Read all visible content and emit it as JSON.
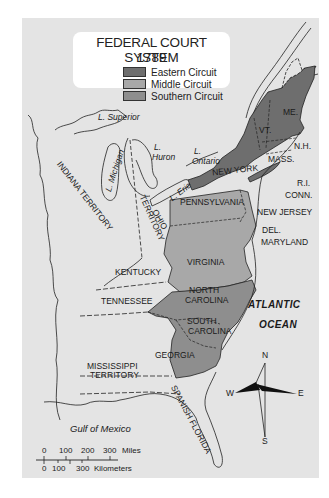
{
  "legend": {
    "title": "FEDERAL COURT SYSTEM",
    "year": "1789",
    "items": [
      {
        "label": "Eastern Circuit",
        "color": "#6e6e6e"
      },
      {
        "label": "Middle Circuit",
        "color": "#a8a8a8"
      },
      {
        "label": "Southern Circuit",
        "color": "#8e8e8e"
      }
    ]
  },
  "colors": {
    "background": "#e4e4e4",
    "unassigned_land": "#e4e4e4",
    "eastern": "#6e6e6e",
    "middle": "#a8a8a8",
    "southern": "#8e8e8e"
  },
  "regions": {
    "eastern": [
      "ME.",
      "VT.",
      "N.H.",
      "MASS.",
      "R.I.",
      "CONN.",
      "NEW YORK"
    ],
    "middle": [
      "PENNSYLVANIA",
      "NEW JERSEY",
      "DEL.",
      "MARYLAND",
      "VIRGINIA"
    ],
    "southern": [
      "NORTH CAROLINA",
      "SOUTH CAROLINA",
      "GEORGIA"
    ]
  },
  "labels": {
    "lake_superior": "L. Superior",
    "lake_michigan": "L. Michigan",
    "lake_huron_1": "L.",
    "lake_huron_2": "Huron",
    "lake_ontario_1": "L.",
    "lake_ontario_2": "Ontario",
    "lake_erie": "L. Erie",
    "indiana_territory": "INDIANA TERRITORY",
    "ohio_territory_1": "OHIO",
    "ohio_territory_2": "TERRITORY",
    "maine": "ME.",
    "vermont": "VT.",
    "new_hampshire": "N.H.",
    "massachusetts": "MASS.",
    "rhode_island": "R.I.",
    "connecticut": "CONN.",
    "new_york": "NEW YORK",
    "pennsylvania": "PENNSYLVANIA",
    "new_jersey": "NEW JERSEY",
    "delaware": "DEL.",
    "maryland": "MARYLAND",
    "virginia": "VIRGINIA",
    "kentucky": "KENTUCKY",
    "tennessee": "TENNESSEE",
    "north_carolina_1": "NORTH",
    "north_carolina_2": "CAROLINA",
    "south_carolina_1": "SOUTH",
    "south_carolina_2": "CAROLINA",
    "georgia": "GEORGIA",
    "mississippi_territory_1": "MISSISSIPPI",
    "mississippi_territory_2": "TERRITORY",
    "spanish_florida": "SPANISH FLORIDA",
    "atlantic_1": "ATLANTIC",
    "atlantic_2": "OCEAN",
    "gulf": "Gulf of Mexico"
  },
  "compass": {
    "n": "N",
    "s": "S",
    "e": "E",
    "w": "W"
  },
  "scale": {
    "miles_ticks": [
      "0",
      "100",
      "200",
      "300"
    ],
    "miles_unit": "Miles",
    "km_ticks": [
      "0",
      "100",
      "300"
    ],
    "km_unit": "Kilometers"
  }
}
